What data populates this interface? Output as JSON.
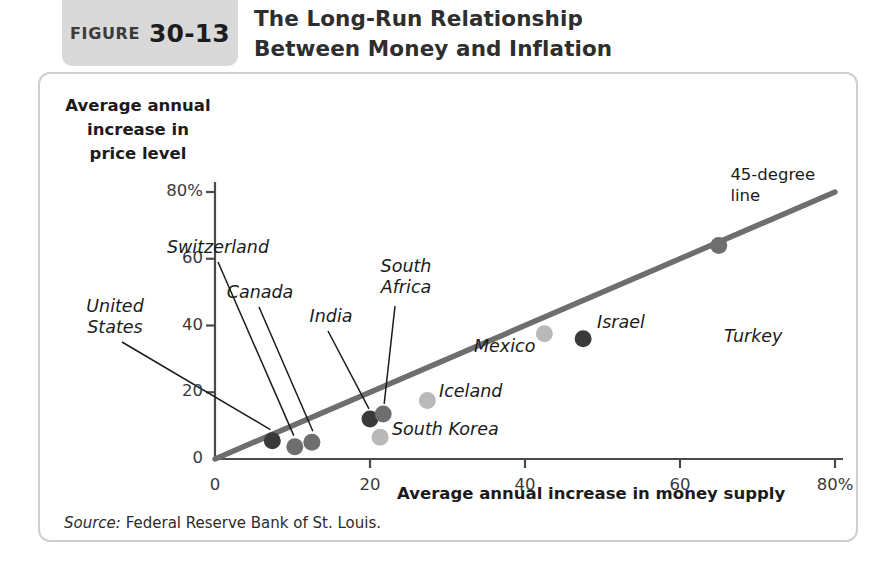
{
  "figure": {
    "badge_word": "FIGURE",
    "badge_number": "30-13",
    "title_line1": "The Long-Run Relationship",
    "title_line2": "Between Money and Inflation"
  },
  "source": {
    "label": "Source:",
    "text": "Federal Reserve Bank of St. Louis."
  },
  "colors": {
    "panel_border": "#cfcfcf",
    "badge_background": "#d9d9d9",
    "axis": "#4a4a4a",
    "trend_line": "#6e6e6e",
    "dot_dark": "#3a3a3a",
    "dot_medium": "#6e6e6e",
    "dot_light": "#b9b9b9",
    "text": "#1b1b1b"
  },
  "chart_data": {
    "type": "scatter",
    "title": "The Long-Run Relationship Between Money and Inflation",
    "xlabel": "Average annual increase in money supply",
    "ylabel": "Average annual increase in price level",
    "xlim": [
      0,
      80
    ],
    "ylim": [
      0,
      80
    ],
    "xticks": [
      "0",
      "20",
      "40",
      "60",
      "80%"
    ],
    "xtick_values": [
      0,
      20,
      40,
      60,
      80
    ],
    "yticks": [
      "0",
      "20",
      "40",
      "60",
      "80%"
    ],
    "ytick_values": [
      0,
      20,
      40,
      60,
      80
    ],
    "grid": false,
    "legend": "none",
    "annotations": [
      {
        "name": "45-degree-line",
        "text_line1": "45-degree",
        "text_line2": "line"
      }
    ],
    "reference_line": {
      "name": "45-degree line",
      "from": [
        0,
        0
      ],
      "to": [
        80,
        80
      ]
    },
    "points": [
      {
        "label": "United States",
        "x": 7.4,
        "y": 5.5,
        "shade": "dark"
      },
      {
        "label": "Switzerland",
        "x": 10.3,
        "y": 3.7,
        "shade": "medium"
      },
      {
        "label": "Canada",
        "x": 12.5,
        "y": 5.0,
        "shade": "medium"
      },
      {
        "label": "India",
        "x": 20.0,
        "y": 12.0,
        "shade": "dark"
      },
      {
        "label": "South Africa",
        "x": 21.7,
        "y": 13.5,
        "shade": "medium"
      },
      {
        "label": "South Korea",
        "x": 21.3,
        "y": 6.5,
        "shade": "light"
      },
      {
        "label": "Iceland",
        "x": 27.4,
        "y": 17.5,
        "shade": "light"
      },
      {
        "label": "Mexico",
        "x": 42.5,
        "y": 37.5,
        "shade": "light"
      },
      {
        "label": "Israel",
        "x": 47.5,
        "y": 36.0,
        "shade": "dark"
      },
      {
        "label": "Turkey",
        "x": 65.0,
        "y": 64.0,
        "shade": "medium"
      }
    ]
  }
}
